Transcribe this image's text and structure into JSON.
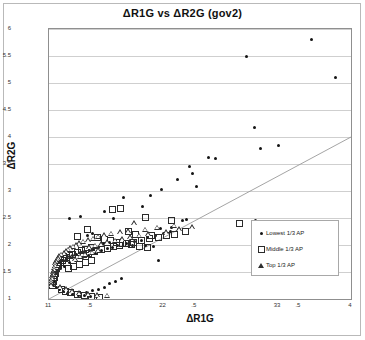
{
  "chart_data": {
    "type": "scatter",
    "title": "ΔR1G vs ΔR2G  (gov2)",
    "xlabel": "ΔR1G",
    "ylabel": "ΔR2G",
    "xlim": [
      1.1,
      4.0
    ],
    "ylim": [
      1.0,
      6.0
    ],
    "grid": true,
    "legend_position": "inside-right",
    "xticks": [
      1.1,
      1.5,
      2.2,
      2.5,
      3.3,
      3.5,
      4.0
    ],
    "xticklabels": [
      "11",
      ".5",
      "22",
      ".5",
      "33",
      ".5",
      "4"
    ],
    "yticks": [
      1,
      1.5,
      2,
      2.5,
      3,
      3.5,
      4,
      4.5,
      5,
      5.5,
      6
    ],
    "yticklabels": [
      "1",
      "1.5",
      "2",
      "2.5",
      "3",
      "3.5",
      "4",
      "4.5",
      "5",
      "5.5",
      "6"
    ],
    "reference_line": {
      "name": "identity-line",
      "from": [
        1.1,
        1.0
      ],
      "to": [
        4.0,
        4.0
      ]
    },
    "series": [
      {
        "name": "Lowest 1/3 AP",
        "marker": "filled-circle",
        "color": "#141414",
        "points": [
          [
            3.62,
            5.8
          ],
          [
            3.0,
            5.5
          ],
          [
            3.85,
            5.1
          ],
          [
            3.07,
            4.17
          ],
          [
            3.3,
            3.85
          ],
          [
            3.13,
            3.78
          ],
          [
            2.63,
            3.62
          ],
          [
            2.7,
            3.6
          ],
          [
            2.45,
            3.45
          ],
          [
            2.48,
            3.33
          ],
          [
            2.33,
            3.22
          ],
          [
            2.52,
            3.08
          ],
          [
            2.18,
            3.02
          ],
          [
            2.07,
            2.92
          ],
          [
            1.82,
            2.88
          ],
          [
            2.0,
            2.72
          ],
          [
            1.63,
            2.62
          ],
          [
            1.4,
            2.52
          ],
          [
            1.3,
            2.5
          ],
          [
            1.72,
            2.5
          ],
          [
            2.42,
            2.47
          ],
          [
            3.08,
            2.45
          ],
          [
            2.28,
            2.33
          ],
          [
            2.17,
            2.3
          ],
          [
            1.52,
            2.22
          ],
          [
            1.47,
            2.18
          ],
          [
            1.96,
            2.15
          ],
          [
            1.88,
            2.12
          ],
          [
            1.8,
            2.1
          ],
          [
            1.74,
            2.08
          ],
          [
            1.68,
            2.05
          ],
          [
            1.62,
            2.02
          ],
          [
            1.9,
            2.0
          ],
          [
            2.03,
            1.99
          ],
          [
            2.1,
            1.97
          ],
          [
            1.58,
            1.95
          ],
          [
            1.53,
            1.92
          ],
          [
            1.49,
            1.9
          ],
          [
            1.44,
            1.88
          ],
          [
            1.4,
            1.86
          ],
          [
            1.36,
            1.83
          ],
          [
            1.33,
            1.8
          ],
          [
            1.3,
            1.78
          ],
          [
            1.27,
            1.75
          ],
          [
            1.24,
            1.72
          ],
          [
            1.21,
            1.7
          ],
          [
            1.19,
            1.67
          ],
          [
            1.17,
            1.64
          ],
          [
            1.15,
            1.61
          ],
          [
            1.25,
            1.6
          ],
          [
            1.21,
            1.56
          ],
          [
            1.18,
            1.53
          ],
          [
            1.16,
            1.5
          ],
          [
            1.14,
            1.47
          ],
          [
            1.13,
            1.44
          ],
          [
            1.12,
            1.41
          ],
          [
            1.3,
            1.68
          ],
          [
            1.35,
            1.72
          ],
          [
            1.42,
            1.76
          ],
          [
            1.48,
            1.81
          ],
          [
            1.55,
            1.85
          ],
          [
            1.6,
            1.89
          ],
          [
            1.66,
            1.93
          ],
          [
            1.71,
            1.96
          ],
          [
            1.76,
            1.99
          ],
          [
            1.84,
            2.03
          ],
          [
            1.92,
            2.06
          ],
          [
            1.99,
            2.09
          ],
          [
            2.05,
            2.13
          ],
          [
            2.12,
            2.17
          ],
          [
            2.2,
            2.21
          ],
          [
            2.27,
            2.25
          ],
          [
            2.34,
            2.28
          ],
          [
            1.12,
            1.3
          ],
          [
            1.14,
            1.26
          ],
          [
            1.17,
            1.22
          ],
          [
            1.2,
            1.18
          ],
          [
            1.24,
            1.14
          ],
          [
            1.28,
            1.11
          ],
          [
            1.33,
            1.09
          ],
          [
            1.38,
            1.07
          ],
          [
            1.44,
            1.06
          ],
          [
            1.5,
            1.05
          ],
          [
            1.56,
            1.04
          ],
          [
            1.63,
            1.22
          ],
          [
            1.58,
            1.18
          ],
          [
            1.52,
            1.15
          ],
          [
            1.46,
            1.12
          ],
          [
            1.68,
            1.28
          ],
          [
            1.74,
            1.33
          ],
          [
            1.8,
            1.38
          ],
          [
            2.15,
            1.72
          ],
          [
            1.13,
            1.36
          ],
          [
            1.15,
            1.33
          ],
          [
            2.38,
            2.45
          ]
        ]
      },
      {
        "name": "Middle 1/3 AP",
        "marker": "open-square",
        "color": "#2b2b2b",
        "points": [
          [
            1.78,
            2.7
          ],
          [
            1.7,
            2.68
          ],
          [
            2.02,
            2.52
          ],
          [
            2.27,
            2.47
          ],
          [
            2.92,
            2.42
          ],
          [
            1.46,
            2.3
          ],
          [
            1.85,
            2.27
          ],
          [
            1.92,
            2.22
          ],
          [
            2.07,
            2.2
          ],
          [
            1.36,
            2.18
          ],
          [
            1.56,
            2.15
          ],
          [
            1.62,
            2.12
          ],
          [
            1.68,
            2.1
          ],
          [
            1.74,
            2.07
          ],
          [
            1.8,
            2.05
          ],
          [
            1.88,
            2.02
          ],
          [
            1.96,
            2.0
          ],
          [
            2.04,
            1.98
          ],
          [
            1.5,
            1.97
          ],
          [
            1.44,
            1.94
          ],
          [
            1.4,
            1.91
          ],
          [
            1.36,
            1.88
          ],
          [
            1.32,
            1.85
          ],
          [
            1.29,
            1.82
          ],
          [
            1.26,
            1.79
          ],
          [
            1.24,
            1.76
          ],
          [
            1.22,
            1.73
          ],
          [
            1.2,
            1.7
          ],
          [
            1.42,
            1.84
          ],
          [
            1.47,
            1.87
          ],
          [
            1.53,
            1.9
          ],
          [
            1.59,
            1.93
          ],
          [
            1.65,
            1.96
          ],
          [
            1.71,
            1.99
          ],
          [
            1.77,
            2.01
          ],
          [
            1.83,
            2.04
          ],
          [
            1.9,
            2.07
          ],
          [
            1.98,
            2.1
          ],
          [
            2.06,
            2.13
          ],
          [
            2.14,
            2.16
          ],
          [
            2.22,
            2.19
          ],
          [
            1.18,
            1.66
          ],
          [
            1.17,
            1.62
          ],
          [
            1.16,
            1.58
          ],
          [
            1.15,
            1.54
          ],
          [
            1.15,
            1.5
          ],
          [
            1.14,
            1.46
          ],
          [
            1.14,
            1.42
          ],
          [
            1.13,
            1.38
          ],
          [
            1.13,
            1.34
          ],
          [
            1.12,
            1.3
          ],
          [
            1.12,
            1.26
          ],
          [
            1.28,
            1.58
          ],
          [
            1.33,
            1.62
          ],
          [
            1.38,
            1.66
          ],
          [
            1.44,
            1.7
          ],
          [
            1.5,
            1.74
          ],
          [
            1.21,
            1.2
          ],
          [
            1.25,
            1.16
          ],
          [
            1.3,
            1.13
          ],
          [
            1.36,
            1.1
          ],
          [
            1.43,
            1.08
          ],
          [
            1.5,
            1.06
          ],
          [
            1.58,
            1.05
          ],
          [
            2.3,
            2.22
          ],
          [
            2.4,
            2.26
          ]
        ]
      },
      {
        "name": "Top 1/3 AP",
        "marker": "triangle",
        "color": "#2f2f2f",
        "points": [
          [
            1.92,
            2.4
          ],
          [
            2.3,
            2.36
          ],
          [
            2.47,
            2.33
          ],
          [
            2.14,
            2.32
          ],
          [
            2.02,
            2.28
          ],
          [
            1.86,
            2.26
          ],
          [
            1.78,
            2.24
          ],
          [
            1.7,
            2.21
          ],
          [
            1.63,
            2.18
          ],
          [
            1.57,
            2.15
          ],
          [
            1.52,
            2.12
          ],
          [
            1.47,
            2.09
          ],
          [
            1.43,
            2.06
          ],
          [
            1.39,
            2.03
          ],
          [
            1.36,
            2.0
          ],
          [
            1.33,
            1.97
          ],
          [
            1.3,
            1.94
          ],
          [
            1.28,
            1.91
          ],
          [
            1.26,
            1.88
          ],
          [
            1.24,
            1.85
          ],
          [
            1.22,
            1.82
          ],
          [
            1.2,
            1.79
          ],
          [
            1.19,
            1.76
          ],
          [
            1.18,
            1.73
          ],
          [
            1.17,
            1.7
          ],
          [
            1.16,
            1.66
          ],
          [
            1.16,
            1.62
          ],
          [
            1.15,
            1.58
          ],
          [
            1.15,
            1.54
          ],
          [
            1.14,
            1.5
          ],
          [
            1.14,
            1.46
          ],
          [
            1.13,
            1.42
          ],
          [
            1.13,
            1.38
          ],
          [
            1.12,
            1.34
          ],
          [
            1.12,
            1.3
          ],
          [
            1.12,
            1.26
          ],
          [
            1.48,
            1.96
          ],
          [
            1.54,
            1.99
          ],
          [
            1.6,
            2.02
          ],
          [
            1.66,
            2.05
          ],
          [
            1.73,
            2.08
          ],
          [
            1.8,
            2.11
          ],
          [
            1.88,
            2.14
          ],
          [
            1.96,
            2.17
          ],
          [
            2.05,
            2.2
          ],
          [
            2.22,
            2.24
          ],
          [
            1.35,
            1.74
          ],
          [
            1.4,
            1.78
          ],
          [
            1.45,
            1.82
          ],
          [
            1.51,
            1.86
          ],
          [
            1.57,
            1.9
          ],
          [
            1.21,
            1.22
          ],
          [
            1.26,
            1.18
          ],
          [
            1.32,
            1.14
          ],
          [
            1.39,
            1.11
          ],
          [
            1.47,
            1.09
          ],
          [
            1.56,
            1.07
          ],
          [
            1.66,
            1.06
          ],
          [
            2.35,
            2.29
          ]
        ]
      }
    ]
  },
  "legend": {
    "items": [
      {
        "label": "Lowest 1/3 AP",
        "symbol": "filled-circle"
      },
      {
        "label": "Middle 1/3 AP",
        "symbol": "open-square"
      },
      {
        "label": "Top 1/3 AP",
        "symbol": "triangle"
      }
    ]
  }
}
